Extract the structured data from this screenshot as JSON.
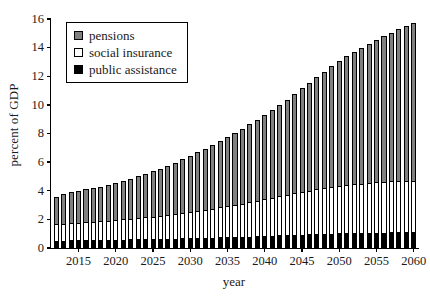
{
  "chart_data": {
    "type": "bar",
    "subtype": "stacked-bar",
    "title": "",
    "xlabel": "year",
    "ylabel": "percent of GDP",
    "xlim": [
      2011.3,
      2060.7
    ],
    "ylim": [
      0,
      16
    ],
    "ytick_values": [
      0,
      2,
      4,
      6,
      8,
      10,
      12,
      14,
      16
    ],
    "ytick_labels": [
      "0",
      "2",
      "4",
      "6",
      "8",
      "10",
      "12",
      "14",
      "16"
    ],
    "xtick_values": [
      2015,
      2020,
      2025,
      2030,
      2035,
      2040,
      2045,
      2050,
      2055,
      2060
    ],
    "xtick_labels": [
      "2015",
      "2020",
      "2025",
      "2030",
      "2035",
      "2040",
      "2045",
      "2050",
      "2055",
      "2060"
    ],
    "grid": false,
    "legend_position": "upper left",
    "categories": [
      2012,
      2013,
      2014,
      2015,
      2016,
      2017,
      2018,
      2019,
      2020,
      2021,
      2022,
      2023,
      2024,
      2025,
      2026,
      2027,
      2028,
      2029,
      2030,
      2031,
      2032,
      2033,
      2034,
      2035,
      2036,
      2037,
      2038,
      2039,
      2040,
      2041,
      2042,
      2043,
      2044,
      2045,
      2046,
      2047,
      2048,
      2049,
      2050,
      2051,
      2052,
      2053,
      2054,
      2055,
      2056,
      2057,
      2058,
      2059,
      2060
    ],
    "series": [
      {
        "name": "public assistance",
        "color": "#000000",
        "values": [
          0.52,
          0.52,
          0.53,
          0.53,
          0.54,
          0.55,
          0.56,
          0.57,
          0.58,
          0.59,
          0.6,
          0.61,
          0.62,
          0.63,
          0.64,
          0.65,
          0.66,
          0.67,
          0.68,
          0.7,
          0.71,
          0.72,
          0.74,
          0.75,
          0.77,
          0.78,
          0.8,
          0.82,
          0.84,
          0.86,
          0.88,
          0.9,
          0.92,
          0.94,
          0.96,
          0.98,
          1.0,
          1.01,
          1.03,
          1.04,
          1.05,
          1.06,
          1.07,
          1.08,
          1.08,
          1.09,
          1.09,
          1.1,
          1.1
        ]
      },
      {
        "name": "social insurance",
        "color": "#ffffff",
        "values": [
          1.18,
          1.19,
          1.21,
          1.23,
          1.25,
          1.28,
          1.31,
          1.34,
          1.37,
          1.41,
          1.45,
          1.49,
          1.53,
          1.57,
          1.62,
          1.67,
          1.72,
          1.78,
          1.84,
          1.9,
          1.96,
          2.03,
          2.1,
          2.17,
          2.25,
          2.33,
          2.41,
          2.49,
          2.57,
          2.65,
          2.73,
          2.81,
          2.89,
          2.97,
          3.04,
          3.11,
          3.18,
          3.24,
          3.3,
          3.35,
          3.4,
          3.44,
          3.48,
          3.51,
          3.54,
          3.56,
          3.58,
          3.59,
          3.6
        ]
      },
      {
        "name": "pensions",
        "color": "#808080",
        "values": [
          1.9,
          2.04,
          2.16,
          2.24,
          2.31,
          2.37,
          2.43,
          2.49,
          2.6,
          2.7,
          2.8,
          2.9,
          3.0,
          3.15,
          3.29,
          3.43,
          3.58,
          3.75,
          3.93,
          4.1,
          4.28,
          4.45,
          4.63,
          4.83,
          5.03,
          5.24,
          5.44,
          5.64,
          5.89,
          6.14,
          6.39,
          6.64,
          6.94,
          7.24,
          7.54,
          7.84,
          8.14,
          8.44,
          8.77,
          9.01,
          9.25,
          9.49,
          9.73,
          9.97,
          10.18,
          10.4,
          10.63,
          10.81,
          11.0
        ]
      }
    ],
    "totals": [
      3.6,
      3.75,
      3.9,
      4.0,
      4.1,
      4.2,
      4.3,
      4.4,
      4.55,
      4.7,
      4.85,
      5.0,
      5.15,
      5.35,
      5.55,
      5.75,
      5.96,
      6.2,
      6.45,
      6.7,
      6.95,
      7.2,
      7.47,
      7.75,
      8.05,
      8.35,
      8.65,
      8.95,
      9.3,
      9.65,
      10.0,
      10.35,
      10.75,
      11.15,
      11.54,
      11.93,
      12.32,
      12.69,
      13.1,
      13.4,
      13.7,
      13.99,
      14.28,
      14.56,
      14.8,
      15.05,
      15.3,
      15.5,
      15.7
    ]
  },
  "legend": {
    "items": [
      {
        "label": "pensions",
        "swatch": "gray-square-icon"
      },
      {
        "label": "social insurance",
        "swatch": "white-square-icon"
      },
      {
        "label": "public assistance",
        "swatch": "black-square-icon"
      }
    ]
  },
  "colors": {
    "pensions": "#808080",
    "social_insurance": "#ffffff",
    "public_assistance": "#000000",
    "axis": "#000000"
  }
}
